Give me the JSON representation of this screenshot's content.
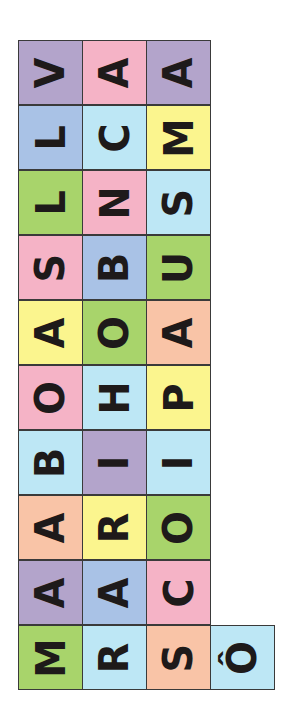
{
  "puzzle": {
    "orientation": "letters rotated 90 degrees counter-clockwise",
    "colors": {
      "purple": "#b3a4cb",
      "pink": "#f5b3c6",
      "blue": "#a9c2e6",
      "cyan": "#bde7f5",
      "yellow": "#fbf58e",
      "green": "#a8d46b",
      "peach": "#f9c4a7"
    },
    "rows": [
      [
        {
          "letter": "V",
          "color": "purple"
        },
        {
          "letter": "A",
          "color": "pink"
        },
        {
          "letter": "A",
          "color": "purple"
        }
      ],
      [
        {
          "letter": "L",
          "color": "blue"
        },
        {
          "letter": "C",
          "color": "cyan"
        },
        {
          "letter": "M",
          "color": "yellow"
        }
      ],
      [
        {
          "letter": "L",
          "color": "green"
        },
        {
          "letter": "N",
          "color": "pink"
        },
        {
          "letter": "S",
          "color": "cyan"
        }
      ],
      [
        {
          "letter": "S",
          "color": "pink"
        },
        {
          "letter": "B",
          "color": "blue"
        },
        {
          "letter": "U",
          "color": "green"
        }
      ],
      [
        {
          "letter": "A",
          "color": "yellow"
        },
        {
          "letter": "O",
          "color": "green"
        },
        {
          "letter": "A",
          "color": "peach"
        }
      ],
      [
        {
          "letter": "O",
          "color": "pink"
        },
        {
          "letter": "H",
          "color": "cyan"
        },
        {
          "letter": "P",
          "color": "yellow"
        }
      ],
      [
        {
          "letter": "B",
          "color": "cyan"
        },
        {
          "letter": "I",
          "color": "purple"
        },
        {
          "letter": "I",
          "color": "cyan"
        }
      ],
      [
        {
          "letter": "A",
          "color": "peach"
        },
        {
          "letter": "R",
          "color": "yellow"
        },
        {
          "letter": "O",
          "color": "green"
        }
      ],
      [
        {
          "letter": "A",
          "color": "purple"
        },
        {
          "letter": "A",
          "color": "blue"
        },
        {
          "letter": "C",
          "color": "pink"
        }
      ],
      [
        {
          "letter": "M",
          "color": "green"
        },
        {
          "letter": "R",
          "color": "cyan"
        },
        {
          "letter": "S",
          "color": "peach"
        },
        {
          "letter": "Ô",
          "color": "cyan"
        }
      ]
    ]
  }
}
